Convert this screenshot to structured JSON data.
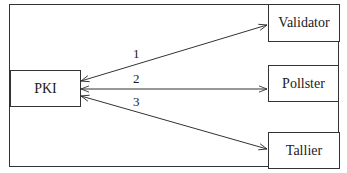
{
  "diagram": {
    "nodes": [
      {
        "id": "pki",
        "label": "PKI"
      },
      {
        "id": "validator",
        "label": "Validator"
      },
      {
        "id": "pollster",
        "label": "Pollster"
      },
      {
        "id": "tallier",
        "label": "Tallier"
      }
    ],
    "edges": [
      {
        "from": "pki",
        "to": "validator",
        "label": "1",
        "bidirectional": true
      },
      {
        "from": "pki",
        "to": "pollster",
        "label": "2",
        "bidirectional": true
      },
      {
        "from": "pki",
        "to": "tallier",
        "label": "3",
        "bidirectional": true
      }
    ],
    "colors": {
      "stroke": "#333333",
      "background": "#ffffff"
    }
  }
}
